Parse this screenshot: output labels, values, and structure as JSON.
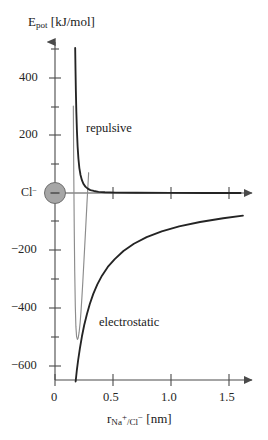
{
  "chart_data": {
    "type": "line",
    "title": "",
    "ylabel": "E_pot [kJ/mol]",
    "ylabel_base": "E",
    "ylabel_sub": "pot",
    "ylabel_unit": "[kJ/mol]",
    "xlabel": "r_Na+/Cl- [nm]",
    "xlabel_base": "r",
    "xlabel_sub_a": "Na",
    "xlabel_sub_a_sup": "+",
    "xlabel_sub_sep": "/Cl",
    "xlabel_sub_b_sup": "−",
    "xlabel_unit": "[nm]",
    "xlim": [
      0,
      1.65
    ],
    "ylim": [
      -700,
      560
    ],
    "grid": false,
    "legend": "inline-annotations",
    "xticks": [
      0,
      0.5,
      1.0,
      1.5
    ],
    "xtick_labels": [
      "0",
      "0.5",
      "1.0",
      "1.5"
    ],
    "xminor_ticks": [
      0.25,
      0.75,
      1.25
    ],
    "yticks": [
      400,
      200,
      0,
      -200,
      -400,
      -600
    ],
    "ytick_labels": [
      "400",
      "200",
      "",
      "−200",
      "−400",
      "−600"
    ],
    "yminor_ticks": [
      500,
      300,
      100,
      -100,
      -300,
      -500
    ],
    "annotations": [
      {
        "name": "repulsive",
        "text": "repulsive",
        "x": 0.27,
        "y": 245
      },
      {
        "name": "electrostatic",
        "text": "electrostatic",
        "x": 0.37,
        "y": -435
      },
      {
        "name": "ion-label",
        "text": "Cl−",
        "x": -0.15,
        "y": 0
      }
    ],
    "ion_marker": {
      "label": "Cl",
      "charge": "−",
      "sign_glyph": "−",
      "x": 0,
      "y": 0,
      "color": "#a6a6a6"
    },
    "series": [
      {
        "name": "total",
        "style": "thin-gray",
        "color": "#8c8c8c",
        "x": [
          0.155,
          0.158,
          0.162,
          0.166,
          0.17,
          0.175,
          0.18,
          0.186,
          0.193,
          0.2,
          0.208,
          0.216,
          0.224,
          0.232,
          0.24,
          0.25,
          0.262,
          0.275,
          0.29
        ],
        "y": [
          560,
          300,
          60,
          -130,
          -270,
          -390,
          -460,
          -495,
          -505,
          -500,
          -480,
          -450,
          -410,
          -360,
          -305,
          -230,
          -140,
          -40,
          70
        ]
      },
      {
        "name": "repulsive",
        "style": "thick-dark",
        "color": "#242424",
        "x": [
          0.172,
          0.174,
          0.177,
          0.18,
          0.184,
          0.189,
          0.195,
          0.202,
          0.21,
          0.22,
          0.232,
          0.246,
          0.262,
          0.282,
          0.305,
          0.335,
          0.375,
          0.43,
          0.52,
          0.7,
          1.0,
          1.3,
          1.6
        ],
        "y": [
          560,
          500,
          420,
          350,
          280,
          215,
          160,
          118,
          86,
          62,
          44,
          31,
          22,
          15,
          10,
          7,
          4,
          2.5,
          1.5,
          0.8,
          0.3,
          0.1,
          0
        ]
      },
      {
        "name": "electrostatic",
        "style": "thick-dark",
        "color": "#242424",
        "x": [
          0.165,
          0.17,
          0.178,
          0.188,
          0.2,
          0.215,
          0.232,
          0.252,
          0.275,
          0.3,
          0.33,
          0.365,
          0.405,
          0.455,
          0.515,
          0.59,
          0.68,
          0.79,
          0.92,
          1.07,
          1.25,
          1.45,
          1.62
        ],
        "y": [
          -700,
          -680,
          -650,
          -612,
          -575,
          -535,
          -495,
          -455,
          -418,
          -383,
          -348,
          -315,
          -285,
          -255,
          -228,
          -200,
          -175,
          -152,
          -132,
          -115,
          -100,
          -87,
          -78
        ]
      }
    ]
  },
  "axes": {
    "y_arrow": true,
    "x_arrow": true
  }
}
